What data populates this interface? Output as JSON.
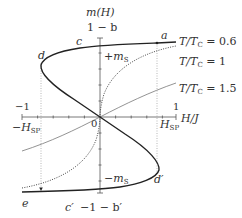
{
  "figure": {
    "y_axis_label": "m(H)",
    "x_axis_label": "H/J",
    "y_top_label": "1 − b",
    "y_bottom_label": "−1 − b′",
    "x_tick_left": "−1",
    "x_tick_right": "1",
    "origin_label": "0",
    "h_sp_pos_label": "H",
    "h_sp_pos_sub": "SP",
    "h_sp_neg_label": "−H",
    "h_sp_neg_sub": "SP",
    "ms_pos_label": "+m",
    "ms_pos_sub": "S",
    "ms_neg_label": "−m",
    "ms_neg_sub": "S",
    "points": {
      "a": "a",
      "c": "c",
      "d": "d",
      "d_prime": "d′",
      "e": "e",
      "c_prime": "c′"
    },
    "curves": [
      {
        "name": "T/T",
        "sub": "C",
        "value": " = 0.6",
        "style": "solid-thick"
      },
      {
        "name": "T/T",
        "sub": "C",
        "value": " = 1",
        "style": "dotted"
      },
      {
        "name": "T/T",
        "sub": "C",
        "value": " = 1.5",
        "style": "solid-thin"
      }
    ],
    "colors": {
      "thick_curve": "#222222",
      "thin_curve": "#777777",
      "axis": "#555555",
      "guide": "#999999"
    }
  }
}
